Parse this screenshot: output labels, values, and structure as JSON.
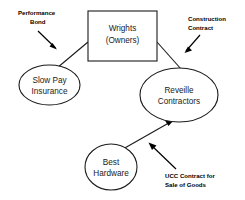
{
  "diagram": {
    "type": "relationship-flow-diagram",
    "background_color": "#ffffff",
    "line_color": "#1a1a1a",
    "text_color": "#1a1a1a",
    "nodes": [
      {
        "id": "wrights",
        "shape": "rectangle",
        "line1": "Wrights",
        "line2": "(Owners)"
      },
      {
        "id": "slow-pay-insurance",
        "shape": "ellipse",
        "line1": "Slow Pay",
        "line2": "Insurance"
      },
      {
        "id": "reveille-contractors",
        "shape": "ellipse",
        "line1": "Reveille",
        "line2": "Contractors"
      },
      {
        "id": "best-hardware",
        "shape": "ellipse",
        "line1": "Best",
        "line2": "Hardware"
      }
    ],
    "edge_labels": [
      {
        "id": "performance-bond",
        "line1": "Performance",
        "line2": "Bond"
      },
      {
        "id": "construction-contract",
        "line1": "Construction",
        "line2": "Contract"
      },
      {
        "id": "ucc-contract",
        "line1": "UCC Contract for",
        "line2": "Sale of Goods"
      }
    ]
  }
}
